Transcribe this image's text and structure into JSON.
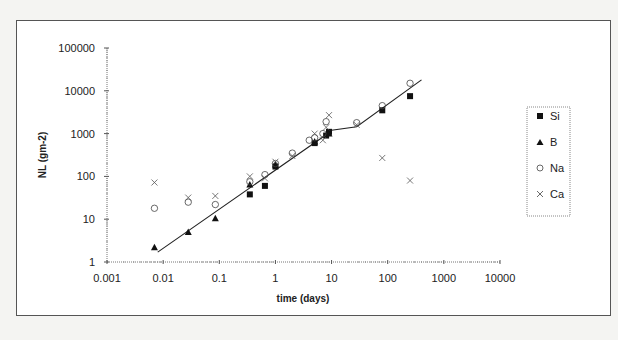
{
  "chart_data": {
    "type": "scatter",
    "title": "",
    "xlabel": "time (days)",
    "ylabel": "NL (gm-2)",
    "xscale": "log",
    "yscale": "log",
    "xlim": [
      0.001,
      10000
    ],
    "ylim": [
      1,
      100000
    ],
    "x_ticks": [
      "0.001",
      "0.01",
      "0.1",
      "1",
      "10",
      "100",
      "1000",
      "10000"
    ],
    "y_ticks": [
      "1",
      "10",
      "100",
      "1000",
      "10000",
      "100000"
    ],
    "grid": false,
    "legend_position": "right",
    "series": [
      {
        "name": "Si",
        "marker": "filled-square",
        "points": [
          [
            0.35,
            38
          ],
          [
            0.65,
            60
          ],
          [
            1.0,
            170
          ],
          [
            5.0,
            600
          ],
          [
            8.0,
            900
          ],
          [
            9.0,
            1100
          ],
          [
            80,
            3500
          ],
          [
            250,
            7500
          ]
        ]
      },
      {
        "name": "B",
        "marker": "filled-triangle",
        "points": [
          [
            0.007,
            2.2
          ],
          [
            0.028,
            5.0
          ],
          [
            0.085,
            10.5
          ],
          [
            0.35,
            65
          ],
          [
            1.0,
            190
          ],
          [
            5.0,
            650
          ],
          [
            9.0,
            1000
          ]
        ]
      },
      {
        "name": "Na",
        "marker": "open-circle",
        "points": [
          [
            0.007,
            18
          ],
          [
            0.028,
            25
          ],
          [
            0.085,
            22
          ],
          [
            0.35,
            75
          ],
          [
            0.65,
            110
          ],
          [
            1.0,
            200
          ],
          [
            2.0,
            350
          ],
          [
            4.0,
            700
          ],
          [
            5.0,
            800
          ],
          [
            7.0,
            1000
          ],
          [
            8.0,
            1900
          ],
          [
            28,
            1800
          ],
          [
            80,
            4500
          ],
          [
            250,
            15000
          ]
        ]
      },
      {
        "name": "Ca",
        "marker": "x",
        "points": [
          [
            0.007,
            72
          ],
          [
            0.028,
            32
          ],
          [
            0.085,
            35
          ],
          [
            0.35,
            100
          ],
          [
            0.65,
            90
          ],
          [
            1.0,
            220
          ],
          [
            2.0,
            300
          ],
          [
            5.0,
            1000
          ],
          [
            7.0,
            700
          ],
          [
            8.0,
            1400
          ],
          [
            9.0,
            2700
          ],
          [
            28,
            1600
          ],
          [
            80,
            270
          ],
          [
            250,
            80
          ]
        ]
      }
    ],
    "fit_line": {
      "points": [
        [
          0.008,
          1.7
        ],
        [
          9.0,
          1050
        ],
        [
          10,
          1200
        ],
        [
          28,
          1450
        ],
        [
          400,
          18000
        ]
      ]
    }
  },
  "legend": {
    "items": [
      {
        "label": "Si"
      },
      {
        "label": "B"
      },
      {
        "label": "Na"
      },
      {
        "label": "Ca"
      }
    ]
  },
  "axes": {
    "x_title": "time (days)",
    "y_title": "NL (gm-2)"
  }
}
